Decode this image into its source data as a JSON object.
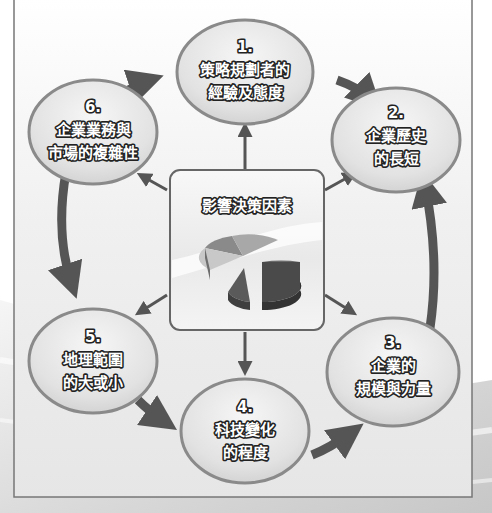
{
  "diagram": {
    "center": {
      "title": "影響決策因素",
      "icon": "pie-chart-icon"
    },
    "nodes": [
      {
        "number": "1.",
        "lines": [
          "策略規劃者的",
          "經驗及態度"
        ]
      },
      {
        "number": "2.",
        "lines": [
          "企業歷史",
          "的長短"
        ]
      },
      {
        "number": "3.",
        "lines": [
          "企業的",
          "規模與力量"
        ]
      },
      {
        "number": "4.",
        "lines": [
          "科技變化",
          "的程度"
        ]
      },
      {
        "number": "5.",
        "lines": [
          "地理範圍",
          "的大或小"
        ]
      },
      {
        "number": "6.",
        "lines": [
          "企業業務與",
          "市場的複雜性"
        ]
      }
    ],
    "cycle_order": [
      "1",
      "2",
      "3",
      "4",
      "5",
      "6"
    ],
    "colors": {
      "arrow": "#555555",
      "node_fill": "#e4e4e4",
      "node_border": "#8a8a8a",
      "frame": "#777777"
    }
  }
}
